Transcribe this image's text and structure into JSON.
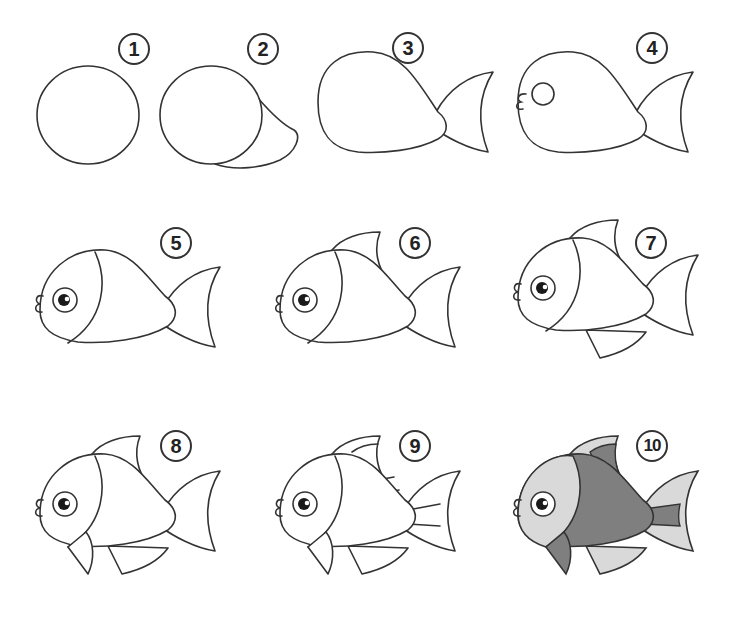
{
  "steps": [
    {
      "number": "1",
      "description": "circle"
    },
    {
      "number": "2",
      "description": "circle with tail bulge"
    },
    {
      "number": "3",
      "description": "teardrop body with tail fin"
    },
    {
      "number": "4",
      "description": "add mouth and eye circle"
    },
    {
      "number": "5",
      "description": "add pupil and head line"
    },
    {
      "number": "6",
      "description": "add dorsal fin"
    },
    {
      "number": "7",
      "description": "add belly fin"
    },
    {
      "number": "8",
      "description": "add pectoral fin"
    },
    {
      "number": "9",
      "description": "add fin stripes"
    },
    {
      "number": "10",
      "description": "colored final fish"
    }
  ],
  "colors": {
    "outline": "#333333",
    "background": "#ffffff",
    "light_fill": "#d9d9d9",
    "dark_fill": "#7f7f7f",
    "pupil": "#1a1a1a"
  }
}
